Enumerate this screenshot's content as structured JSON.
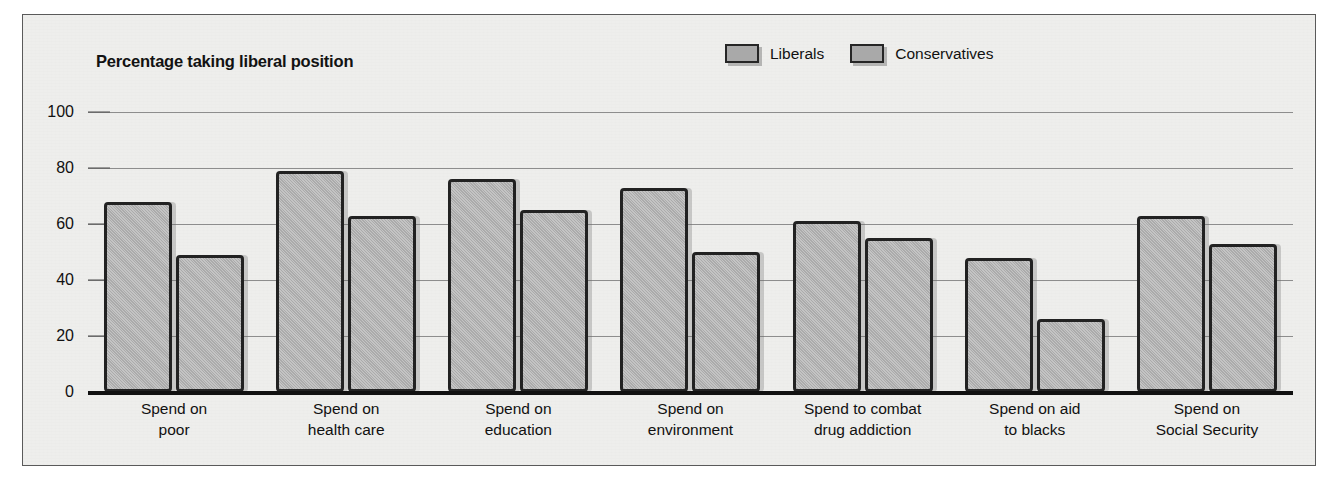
{
  "chart_data": {
    "type": "bar",
    "title": "Percentage taking liberal position",
    "xlabel": "",
    "ylabel": "",
    "ylim": [
      0,
      100
    ],
    "yticks": [
      0,
      20,
      40,
      60,
      80,
      100
    ],
    "grid": true,
    "legend_position": "top-right",
    "categories": [
      "Spend on poor",
      "Spend on health care",
      "Spend on education",
      "Spend on environment",
      "Spend to combat drug addiction",
      "Spend on aid to blacks",
      "Spend on Social Security"
    ],
    "category_lines": [
      [
        "Spend on",
        "poor"
      ],
      [
        "Spend on",
        "health care"
      ],
      [
        "Spend on",
        "education"
      ],
      [
        "Spend on",
        "environment"
      ],
      [
        "Spend to combat",
        "drug addiction"
      ],
      [
        "Spend on aid",
        "to blacks"
      ],
      [
        "Spend on",
        "Social Security"
      ]
    ],
    "series": [
      {
        "name": "Liberals",
        "values": [
          68,
          79,
          76,
          73,
          61,
          48,
          63
        ]
      },
      {
        "name": "Conservatives",
        "values": [
          49,
          63,
          65,
          50,
          55,
          26,
          53
        ]
      }
    ],
    "colors": {
      "bar_fill": "#ababab",
      "bar_outline": "#222222",
      "panel_background": "#eeeeec",
      "gridline": "#8d8d8d",
      "axis": "#111111",
      "text": "#111111"
    }
  }
}
